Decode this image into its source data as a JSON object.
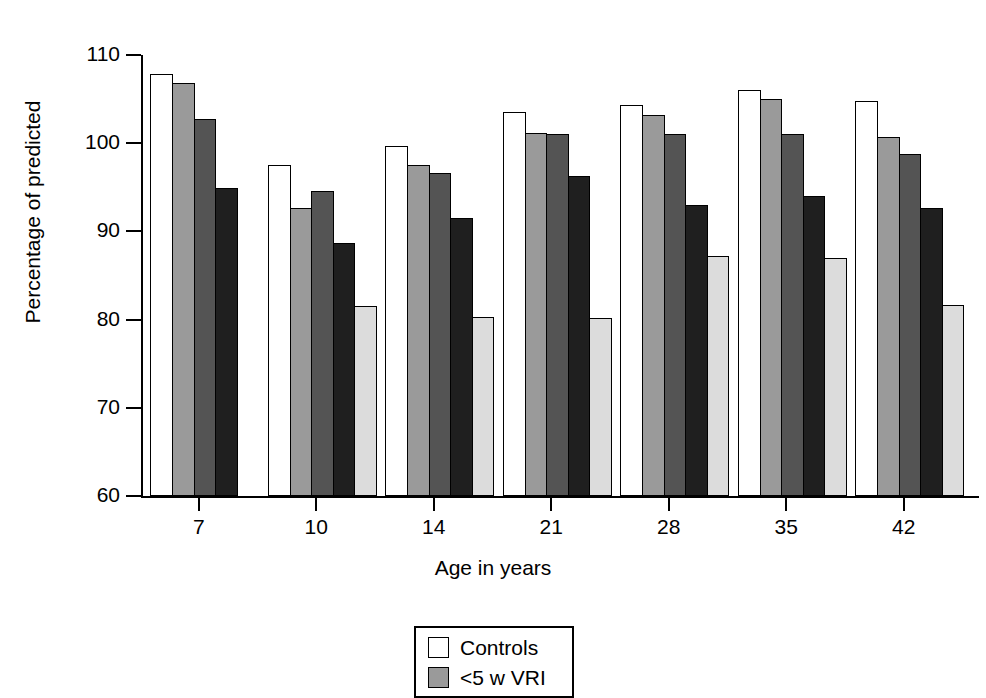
{
  "chart_data": {
    "type": "bar",
    "title": "",
    "xlabel": "Age in years",
    "ylabel": "Percentage of predicted",
    "categories": [
      "7",
      "10",
      "14",
      "21",
      "28",
      "35",
      "42"
    ],
    "ylim": [
      60,
      110
    ],
    "yticks": [
      60,
      70,
      80,
      90,
      100,
      110
    ],
    "grid": false,
    "legend_position": "bottom-center",
    "series": [
      {
        "name": "Controls",
        "color": "#ffffff",
        "values": [
          107.8,
          97.5,
          99.7,
          103.5,
          104.3,
          106.0,
          104.8
        ]
      },
      {
        "name": "<5 w VRI",
        "color": "#9a9a9a",
        "values": [
          106.8,
          92.7,
          97.5,
          101.2,
          103.2,
          105.0,
          100.7
        ]
      },
      {
        "name": "series-3",
        "color": "#545454",
        "values": [
          102.7,
          94.6,
          96.6,
          101.1,
          101.0,
          101.0,
          98.8
        ]
      },
      {
        "name": "series-4",
        "color": "#1f1f1f",
        "values": [
          94.9,
          88.7,
          91.5,
          96.3,
          93.0,
          94.0,
          92.6
        ]
      },
      {
        "name": "series-5",
        "color": "#dcdcdc",
        "values": [
          null,
          81.5,
          80.3,
          80.2,
          87.2,
          87.0,
          81.7
        ]
      }
    ]
  },
  "legend": {
    "entries": [
      {
        "label": "Controls",
        "color": "#ffffff"
      },
      {
        "label": "<5 w VRI",
        "color": "#9a9a9a"
      }
    ]
  }
}
